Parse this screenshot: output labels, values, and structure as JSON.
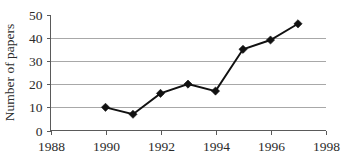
{
  "chart_data": {
    "type": "line",
    "title": "",
    "xlabel": "",
    "ylabel": "Number of papers",
    "x": [
      1990,
      1991,
      1992,
      1993,
      1994,
      1995,
      1996,
      1997
    ],
    "values": [
      10,
      7,
      16,
      20,
      17,
      35,
      39,
      46
    ],
    "series": [
      {
        "name": "Number of papers",
        "x": [
          1990,
          1991,
          1992,
          1993,
          1994,
          1995,
          1996,
          1997
        ],
        "values": [
          10,
          7,
          16,
          20,
          17,
          35,
          39,
          46
        ]
      }
    ],
    "xlim": [
      1988,
      1998
    ],
    "ylim": [
      0,
      50
    ],
    "xticks": [
      1988,
      1990,
      1992,
      1994,
      1996,
      1998
    ],
    "xtick_labels": [
      "1988",
      "1990",
      "1992",
      "1994",
      "1996",
      "1998"
    ],
    "yticks": [
      0,
      10,
      20,
      30,
      40,
      50
    ],
    "ytick_labels": [
      "0",
      "10",
      "20",
      "30",
      "40",
      "50"
    ],
    "gridlines_y": [
      10,
      20,
      30,
      40
    ],
    "grid": true,
    "legend": false,
    "legend_position": "none",
    "marker": "diamond",
    "line_color": "#111111",
    "marker_color": "#111111",
    "grid_color": "#a8a8a8",
    "axis_color": "#5a5a5a",
    "background_color": "#ffffff"
  }
}
